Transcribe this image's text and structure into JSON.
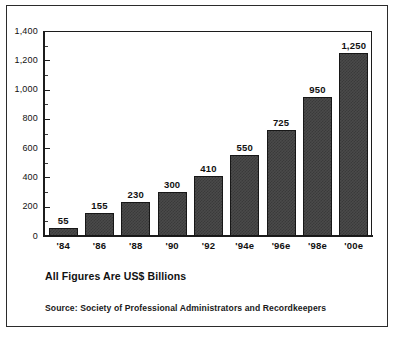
{
  "chart_data": {
    "type": "bar",
    "title": "",
    "subtitle": "",
    "xlabel": "",
    "ylabel": "",
    "categories": [
      "'84",
      "'86",
      "'88",
      "'90",
      "'92",
      "'94e",
      "'96e",
      "'98e",
      "'00e"
    ],
    "values": [
      55,
      155,
      230,
      300,
      410,
      550,
      725,
      950,
      1250
    ],
    "value_labels": [
      "55",
      "155",
      "230",
      "300",
      "410",
      "550",
      "725",
      "950",
      "1,250"
    ],
    "ylim": [
      0,
      1400
    ],
    "ytick_values": [
      0,
      200,
      400,
      600,
      800,
      1000,
      1200,
      1400
    ],
    "ytick_labels": [
      "0",
      "200",
      "400",
      "600",
      "800",
      "1,000",
      "1,200",
      "1,400"
    ],
    "yminor_values": [
      100,
      300,
      500,
      700,
      900,
      1100,
      1300
    ],
    "grid": false,
    "legend": "none",
    "series": [
      {
        "name": "Assets",
        "values": [
          55,
          155,
          230,
          300,
          410,
          550,
          725,
          950,
          1250
        ]
      }
    ]
  },
  "captions": {
    "units": "All Figures Are US$ Billions",
    "source": "Source: Society of Professional Administrators and Recordkeepers"
  },
  "colors": {
    "bar_fill": "#4a4a4a",
    "bar_dither": "#3a3a3a",
    "bar_border": "#171717",
    "axis": "#1c1c1c",
    "text": "#111111",
    "background": "#ffffff",
    "frame": "#2b2b2b"
  }
}
